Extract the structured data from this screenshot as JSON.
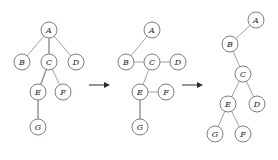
{
  "figure": {
    "name": "tree-rotation-sequence",
    "node_radius": 8,
    "colors": {
      "node_fill": "#ffffff",
      "node_stroke": "#6f6f6f",
      "edge": "#8a8a8a",
      "edge_highlight": "#9c9c9c",
      "label": "#1c1c1c",
      "arrow": "#2a2a2a",
      "background": "#ffffff"
    },
    "panels": [
      {
        "id": "panel-1",
        "name": "general-tree",
        "nodes": [
          {
            "id": "A",
            "label": "A",
            "x": 49,
            "y": 30
          },
          {
            "id": "B",
            "label": "B",
            "x": 22,
            "y": 62
          },
          {
            "id": "C",
            "label": "C",
            "x": 49,
            "y": 62
          },
          {
            "id": "D",
            "label": "D",
            "x": 76,
            "y": 62
          },
          {
            "id": "E",
            "label": "E",
            "x": 38,
            "y": 92
          },
          {
            "id": "F",
            "label": "F",
            "x": 63,
            "y": 92
          },
          {
            "id": "G",
            "label": "G",
            "x": 38,
            "y": 127
          }
        ],
        "edges": [
          {
            "from": "A",
            "to": "B",
            "style": "thin"
          },
          {
            "from": "A",
            "to": "C",
            "style": "bold"
          },
          {
            "from": "A",
            "to": "D",
            "style": "thin"
          },
          {
            "from": "C",
            "to": "E",
            "style": "bold"
          },
          {
            "from": "C",
            "to": "F",
            "style": "thin"
          },
          {
            "from": "E",
            "to": "G",
            "style": "bold"
          }
        ]
      },
      {
        "id": "panel-2",
        "name": "left-child-right-sibling-links",
        "nodes": [
          {
            "id": "A",
            "label": "A",
            "x": 152,
            "y": 30
          },
          {
            "id": "B",
            "label": "B",
            "x": 126,
            "y": 62
          },
          {
            "id": "C",
            "label": "C",
            "x": 152,
            "y": 62
          },
          {
            "id": "D",
            "label": "D",
            "x": 178,
            "y": 62
          },
          {
            "id": "E",
            "label": "E",
            "x": 140,
            "y": 92
          },
          {
            "id": "F",
            "label": "F",
            "x": 166,
            "y": 92
          },
          {
            "id": "G",
            "label": "G",
            "x": 140,
            "y": 127
          }
        ],
        "edges": [
          {
            "from": "A",
            "to": "B",
            "style": "thin"
          },
          {
            "from": "B",
            "to": "C",
            "style": "thin"
          },
          {
            "from": "C",
            "to": "D",
            "style": "thin"
          },
          {
            "from": "C",
            "to": "E",
            "style": "thin"
          },
          {
            "from": "E",
            "to": "F",
            "style": "thin"
          },
          {
            "from": "E",
            "to": "G",
            "style": "bold"
          }
        ]
      },
      {
        "id": "panel-3",
        "name": "binary-tree-result",
        "nodes": [
          {
            "id": "A",
            "label": "A",
            "x": 256,
            "y": 20
          },
          {
            "id": "B",
            "label": "B",
            "x": 230,
            "y": 44
          },
          {
            "id": "C",
            "label": "C",
            "x": 243,
            "y": 74
          },
          {
            "id": "E",
            "label": "E",
            "x": 228,
            "y": 104
          },
          {
            "id": "D",
            "label": "D",
            "x": 257,
            "y": 104
          },
          {
            "id": "G",
            "label": "G",
            "x": 215,
            "y": 134
          },
          {
            "id": "F",
            "label": "F",
            "x": 243,
            "y": 134
          }
        ],
        "edges": [
          {
            "from": "A",
            "to": "B",
            "style": "thin"
          },
          {
            "from": "B",
            "to": "C",
            "style": "thin"
          },
          {
            "from": "C",
            "to": "E",
            "style": "thin"
          },
          {
            "from": "C",
            "to": "D",
            "style": "thin"
          },
          {
            "from": "E",
            "to": "G",
            "style": "thin"
          },
          {
            "from": "E",
            "to": "F",
            "style": "thin"
          }
        ]
      }
    ],
    "arrows": [
      {
        "id": "arrow-1",
        "name": "transition-arrow-1",
        "x1": 89,
        "y1": 85,
        "x2": 110,
        "y2": 85
      },
      {
        "id": "arrow-2",
        "name": "transition-arrow-2",
        "x1": 182,
        "y1": 85,
        "x2": 203,
        "y2": 85
      }
    ]
  }
}
